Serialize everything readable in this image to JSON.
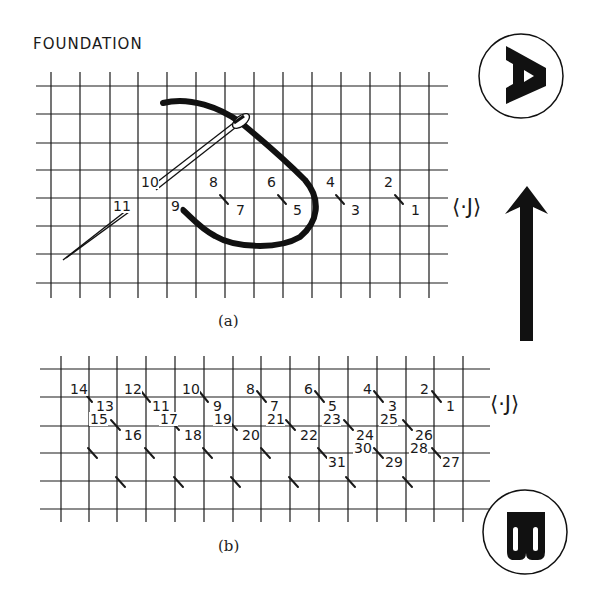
{
  "title": "FOUNDATION",
  "colors": {
    "ink": "#1a1a1a",
    "background": "#ffffff"
  },
  "figure_a": {
    "caption": "(a)",
    "grid": {
      "cols_x": [
        51,
        80,
        110,
        138,
        167,
        196,
        225,
        254,
        283,
        312,
        341,
        370,
        400,
        429
      ],
      "rows_y": [
        86,
        114,
        143,
        170,
        198,
        226,
        254,
        283
      ]
    },
    "stitch_labels": [
      {
        "text": "2",
        "x": 384,
        "y": 187
      },
      {
        "text": "1",
        "x": 411,
        "y": 215
      },
      {
        "text": "4",
        "x": 326,
        "y": 187
      },
      {
        "text": "3",
        "x": 351,
        "y": 215
      },
      {
        "text": "6",
        "x": 267,
        "y": 187
      },
      {
        "text": "5",
        "x": 293,
        "y": 215
      },
      {
        "text": "8",
        "x": 209,
        "y": 187
      },
      {
        "text": "7",
        "x": 236,
        "y": 215
      },
      {
        "text": "10",
        "x": 141,
        "y": 187
      },
      {
        "text": "9",
        "x": 171,
        "y": 211
      },
      {
        "text": "11",
        "x": 113,
        "y": 211
      }
    ],
    "direction_symbol": "⟨·J⟩"
  },
  "figure_b": {
    "caption": "(b)",
    "grid": {
      "cols_x": [
        61,
        89,
        117,
        146,
        175,
        204,
        233,
        261,
        290,
        319,
        348,
        377,
        406,
        434,
        463
      ],
      "rows_y": [
        369,
        397,
        426,
        453,
        481,
        509
      ]
    },
    "stitch_labels": [
      {
        "text": "14",
        "x": 70,
        "y": 394
      },
      {
        "text": "13",
        "x": 96,
        "y": 411
      },
      {
        "text": "15",
        "x": 90,
        "y": 424
      },
      {
        "text": "16",
        "x": 124,
        "y": 440
      },
      {
        "text": "12",
        "x": 124,
        "y": 394
      },
      {
        "text": "11",
        "x": 152,
        "y": 411
      },
      {
        "text": "17",
        "x": 160,
        "y": 424
      },
      {
        "text": "18",
        "x": 184,
        "y": 440
      },
      {
        "text": "10",
        "x": 182,
        "y": 394
      },
      {
        "text": "9",
        "x": 213,
        "y": 411
      },
      {
        "text": "19",
        "x": 214,
        "y": 424
      },
      {
        "text": "20",
        "x": 242,
        "y": 440
      },
      {
        "text": "8",
        "x": 246,
        "y": 394
      },
      {
        "text": "7",
        "x": 270,
        "y": 411
      },
      {
        "text": "21",
        "x": 267,
        "y": 424
      },
      {
        "text": "22",
        "x": 300,
        "y": 440
      },
      {
        "text": "6",
        "x": 304,
        "y": 394
      },
      {
        "text": "5",
        "x": 328,
        "y": 411
      },
      {
        "text": "23",
        "x": 323,
        "y": 424
      },
      {
        "text": "24",
        "x": 356,
        "y": 440
      },
      {
        "text": "4",
        "x": 363,
        "y": 394
      },
      {
        "text": "3",
        "x": 388,
        "y": 411
      },
      {
        "text": "25",
        "x": 380,
        "y": 424
      },
      {
        "text": "26",
        "x": 415,
        "y": 440
      },
      {
        "text": "2",
        "x": 420,
        "y": 394
      },
      {
        "text": "1",
        "x": 446,
        "y": 411
      },
      {
        "text": "30",
        "x": 354,
        "y": 453
      },
      {
        "text": "29",
        "x": 385,
        "y": 467
      },
      {
        "text": "28",
        "x": 410,
        "y": 453
      },
      {
        "text": "27",
        "x": 442,
        "y": 467
      },
      {
        "text": "31",
        "x": 328,
        "y": 467
      }
    ],
    "direction_symbol": "⟨·J⟩"
  },
  "side_panel": {
    "badge_a": "A",
    "badge_b": "B",
    "arrow": "up-arrow"
  }
}
